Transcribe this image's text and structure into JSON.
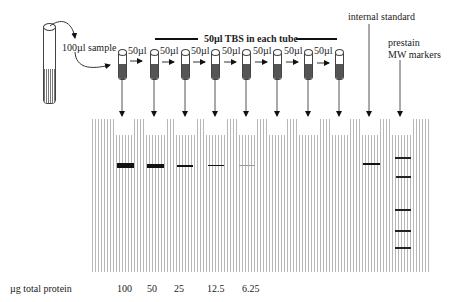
{
  "diagram": {
    "stock_label": "100µl sample",
    "transfer_label": "50µl",
    "tbs_label": "50µl TBS in each tube",
    "internal_standard_label": "internal standard",
    "markers_label_line1": "prestain",
    "markers_label_line2": "MW markers",
    "row_label": "µg total protein",
    "amounts": [
      "100",
      "50",
      "25",
      "12.5",
      "6.25"
    ],
    "colors": {
      "ink": "#111111",
      "gel_line": "#b8b8b8",
      "tube_fill": "#555555"
    }
  }
}
